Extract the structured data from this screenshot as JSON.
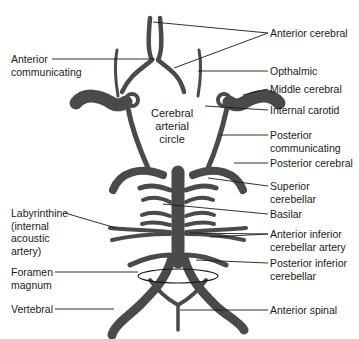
{
  "diagram": {
    "title_center": "Cerebral\narterial\ncircle",
    "vessel_color": "#4a4a4a",
    "line_color": "#1a1a1a",
    "labels_left": [
      {
        "id": "anterior-communicating",
        "text": "Anterior\ncommunicating"
      },
      {
        "id": "labyrinthine",
        "text": "Labyrinthine\n(internal\nacoustic\nartery)"
      },
      {
        "id": "foramen-magnum",
        "text": "Foramen\nmagnum"
      },
      {
        "id": "vertebral",
        "text": "Vertebral"
      }
    ],
    "labels_right": [
      {
        "id": "anterior-cerebral",
        "text": "Anterior cerebral"
      },
      {
        "id": "opthalmic",
        "text": "Opthalmic"
      },
      {
        "id": "middle-cerebral",
        "text": "Middle cerebral"
      },
      {
        "id": "internal-carotid",
        "text": "Internal carotid"
      },
      {
        "id": "posterior-communicating",
        "text": "Posterior\ncommunicating"
      },
      {
        "id": "posterior-cerebral",
        "text": "Posterior cerebral"
      },
      {
        "id": "superior-cerebellar",
        "text": "Superior\ncerebellar"
      },
      {
        "id": "basilar",
        "text": "Basilar"
      },
      {
        "id": "anterior-inferior-cerebellar",
        "text": "Anterior inferior\ncerebellar artery"
      },
      {
        "id": "posterior-inferior-cerebellar",
        "text": "Posterior inferior\ncerebellar"
      },
      {
        "id": "anterior-spinal",
        "text": "Anterior spinal"
      }
    ]
  }
}
